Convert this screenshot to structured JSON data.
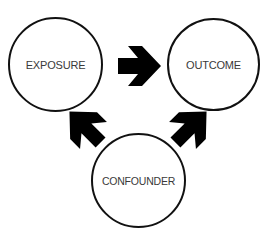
{
  "diagram": {
    "type": "causal-diagram",
    "nodes": [
      {
        "id": "exposure",
        "label": "EXPOSURE"
      },
      {
        "id": "outcome",
        "label": "OUTCOME"
      },
      {
        "id": "confounder",
        "label": "CONFOUNDER"
      }
    ],
    "edges": [
      {
        "from": "exposure",
        "to": "outcome",
        "direction": "right"
      },
      {
        "from": "confounder",
        "to": "exposure",
        "direction": "up-left"
      },
      {
        "from": "confounder",
        "to": "outcome",
        "direction": "up-right"
      }
    ],
    "colors": {
      "stroke": "#111111",
      "arrow": "#000000",
      "label": "#3a3a3a",
      "background": "#ffffff"
    }
  }
}
